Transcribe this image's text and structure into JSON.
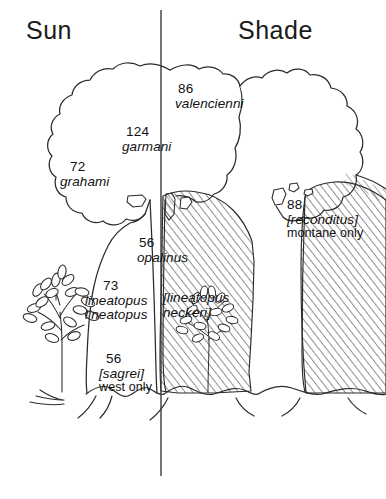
{
  "figure": {
    "divider_label": "sun-shade-divider"
  },
  "header": {
    "left_label": "Sun",
    "right_label": "Shade"
  },
  "annotations": [
    {
      "id": "valencienni",
      "number": "86",
      "species": "valencienni",
      "species2": "",
      "note": "",
      "bracketed": false
    },
    {
      "id": "garmani",
      "number": "124",
      "species": "garmani",
      "species2": "",
      "note": "",
      "bracketed": false
    },
    {
      "id": "grahami",
      "number": "72",
      "species": "grahami",
      "species2": "",
      "note": "",
      "bracketed": false
    },
    {
      "id": "opalinus",
      "number": "56",
      "species": "opalinus",
      "species2": "",
      "note": "",
      "bracketed": false
    },
    {
      "id": "reconditus",
      "number": "88",
      "species": "[reconditus]",
      "species2": "",
      "note": "montane only",
      "bracketed": true
    },
    {
      "id": "lineatopus",
      "number": "73",
      "species": "lineatopus",
      "species2": "lineatopus",
      "note": "",
      "bracketed": false
    },
    {
      "id": "neckeri",
      "number": "",
      "species": "[lineatopus",
      "species2": "neckeri]",
      "note": "",
      "bracketed": true
    },
    {
      "id": "sagrei",
      "number": "56",
      "species": "[sagrei]",
      "species2": "",
      "note": "west only",
      "bracketed": true
    }
  ],
  "graphics": {
    "left_tree_canopy": "sun-canopy-outline",
    "right_tree_canopy": "shade-canopy-outline",
    "shaded_trunk": "hatched-shade-region",
    "left_shrub": "sun-shrub",
    "shade_shrub": "shade-shrub",
    "ground_line": "ground-line",
    "lizard_silhouettes": 5
  },
  "colors": {
    "ink": "#1a1a1a",
    "paper": "#ffffff",
    "hatch": "#2b2b2b",
    "divider": "#3a3a3a"
  }
}
